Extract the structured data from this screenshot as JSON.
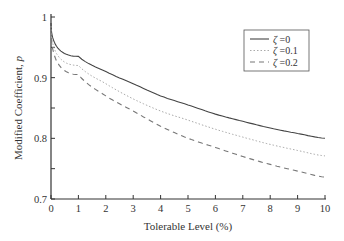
{
  "chart_data": {
    "type": "line",
    "title": "",
    "xlabel": "Tolerable Level (%)",
    "ylabel": "Modified Coefficient, p",
    "xlim": [
      0,
      10
    ],
    "ylim": [
      0.7,
      1.0
    ],
    "x_ticks": [
      "0",
      "1",
      "2",
      "3",
      "4",
      "5",
      "6",
      "7",
      "8",
      "9",
      "10"
    ],
    "y_ticks": [
      "0.7",
      "0.8",
      "0.9",
      "1"
    ],
    "y_minor_ticks": [
      0.75,
      0.85,
      0.95
    ],
    "grid": false,
    "legend_position": "top-right",
    "x": [
      0,
      1,
      2,
      3,
      4,
      5,
      6,
      7,
      8,
      9,
      10
    ],
    "series": [
      {
        "name": "ζ =0",
        "style": "solid",
        "color": "#444444",
        "values": [
          0.99,
          0.935,
          0.91,
          0.89,
          0.87,
          0.855,
          0.84,
          0.828,
          0.817,
          0.808,
          0.8
        ]
      },
      {
        "name": "ζ =0.1",
        "style": "dotted",
        "color": "#aaaaaa",
        "values": [
          0.985,
          0.92,
          0.89,
          0.865,
          0.845,
          0.83,
          0.815,
          0.802,
          0.79,
          0.78,
          0.771
        ]
      },
      {
        "name": "ζ =0.2",
        "style": "dashed",
        "color": "#777777",
        "values": [
          0.98,
          0.905,
          0.87,
          0.845,
          0.82,
          0.8,
          0.785,
          0.77,
          0.757,
          0.746,
          0.736
        ]
      }
    ]
  }
}
